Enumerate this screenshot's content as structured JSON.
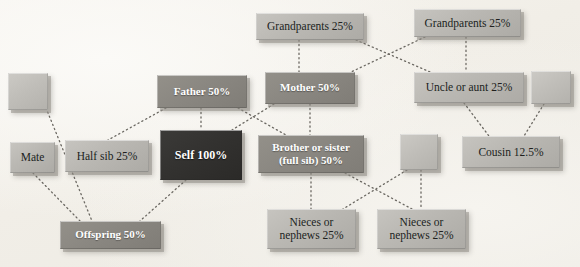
{
  "diagram": {
    "background_color": "#f2efe9",
    "tones": {
      "light": "#bab8b3",
      "medium": "#8a8781",
      "dark": "#333230",
      "blank": "#c0beb9",
      "edge": "#6b6862"
    },
    "edge_style": "dotted",
    "nodes": [
      {
        "id": "blank_topleft",
        "label": "",
        "tone": "blank",
        "x": 8,
        "y": 73,
        "w": 40,
        "h": 37
      },
      {
        "id": "father",
        "label": "Father 50%",
        "tone": "medium",
        "x": 157,
        "y": 75,
        "w": 90,
        "h": 33
      },
      {
        "id": "mother",
        "label": "Mother 50%",
        "tone": "medium",
        "x": 265,
        "y": 72,
        "w": 90,
        "h": 32
      },
      {
        "id": "grandparents_left",
        "label": "Grandparents 25%",
        "tone": "light",
        "x": 256,
        "y": 13,
        "w": 108,
        "h": 27
      },
      {
        "id": "grandparents_right",
        "label": "Grandparents 25%",
        "tone": "light",
        "x": 414,
        "y": 9,
        "w": 107,
        "h": 28
      },
      {
        "id": "uncle_aunt",
        "label": "Uncle or aunt 25%",
        "tone": "light",
        "x": 414,
        "y": 72,
        "w": 110,
        "h": 31
      },
      {
        "id": "blank_topright",
        "label": "",
        "tone": "blank",
        "x": 531,
        "y": 71,
        "w": 40,
        "h": 33
      },
      {
        "id": "mate",
        "label": "Mate",
        "tone": "light",
        "x": 10,
        "y": 142,
        "w": 45,
        "h": 31
      },
      {
        "id": "half_sib",
        "label": "Half sib 25%",
        "tone": "light",
        "x": 65,
        "y": 140,
        "w": 84,
        "h": 32
      },
      {
        "id": "self",
        "label": "Self 100%",
        "tone": "dark",
        "x": 160,
        "y": 130,
        "w": 82,
        "h": 50
      },
      {
        "id": "brother_sister",
        "label": "Brother or sister\n(full sib) 50%",
        "tone": "medium",
        "x": 258,
        "y": 135,
        "w": 106,
        "h": 38
      },
      {
        "id": "blank_middle",
        "label": "",
        "tone": "blank",
        "x": 400,
        "y": 134,
        "w": 38,
        "h": 36
      },
      {
        "id": "cousin",
        "label": "Cousin 12.5%",
        "tone": "light",
        "x": 462,
        "y": 136,
        "w": 98,
        "h": 32
      },
      {
        "id": "offspring",
        "label": "Offspring 50%",
        "tone": "medium",
        "x": 60,
        "y": 221,
        "w": 101,
        "h": 28
      },
      {
        "id": "nieces_nephews_left",
        "label": "Nieces or\nnephews 25%",
        "tone": "light",
        "x": 267,
        "y": 209,
        "w": 89,
        "h": 40
      },
      {
        "id": "nieces_nephews_right",
        "label": "Nieces or\nnephews 25%",
        "tone": "light",
        "x": 377,
        "y": 209,
        "w": 89,
        "h": 40
      }
    ],
    "edges": [
      {
        "from": "blank_topleft",
        "to": "offspring",
        "fx": 46,
        "fy": 108,
        "tx": 92,
        "ty": 221
      },
      {
        "from": "father",
        "to": "self",
        "fx": 201,
        "fy": 108,
        "tx": 201,
        "ty": 130
      },
      {
        "from": "father",
        "to": "half_sib",
        "fx": 166,
        "fy": 108,
        "tx": 108,
        "ty": 140
      },
      {
        "from": "father",
        "to": "brother_sister",
        "fx": 238,
        "fy": 108,
        "tx": 286,
        "ty": 135
      },
      {
        "from": "mother",
        "to": "self",
        "fx": 274,
        "fy": 104,
        "tx": 232,
        "ty": 130
      },
      {
        "from": "mother",
        "to": "brother_sister",
        "fx": 310,
        "fy": 104,
        "tx": 310,
        "ty": 135
      },
      {
        "from": "grandparents_left",
        "to": "mother",
        "fx": 299,
        "fy": 40,
        "tx": 299,
        "ty": 72
      },
      {
        "from": "grandparents_left",
        "to": "uncle_aunt",
        "fx": 356,
        "fy": 40,
        "tx": 430,
        "ty": 72
      },
      {
        "from": "grandparents_right",
        "to": "mother",
        "fx": 425,
        "fy": 37,
        "tx": 351,
        "ty": 72
      },
      {
        "from": "grandparents_right",
        "to": "uncle_aunt",
        "fx": 466,
        "fy": 37,
        "tx": 466,
        "ty": 72
      },
      {
        "from": "uncle_aunt",
        "to": "cousin",
        "fx": 464,
        "fy": 103,
        "tx": 489,
        "ty": 136
      },
      {
        "from": "blank_topright",
        "to": "cousin",
        "fx": 544,
        "fy": 104,
        "tx": 524,
        "ty": 136
      },
      {
        "from": "mate",
        "to": "offspring",
        "fx": 33,
        "fy": 173,
        "tx": 80,
        "ty": 221
      },
      {
        "from": "self",
        "to": "offspring",
        "fx": 186,
        "fy": 180,
        "tx": 140,
        "ty": 221
      },
      {
        "from": "brother_sister",
        "to": "nieces_nephews_left",
        "fx": 311,
        "fy": 173,
        "tx": 311,
        "ty": 209
      },
      {
        "from": "brother_sister",
        "to": "nieces_nephews_right",
        "fx": 345,
        "fy": 173,
        "tx": 412,
        "ty": 209
      },
      {
        "from": "blank_middle",
        "to": "nieces_nephews_left",
        "fx": 407,
        "fy": 170,
        "tx": 343,
        "ty": 209
      },
      {
        "from": "blank_middle",
        "to": "nieces_nephews_right",
        "fx": 421,
        "fy": 170,
        "tx": 421,
        "ty": 209
      }
    ]
  }
}
